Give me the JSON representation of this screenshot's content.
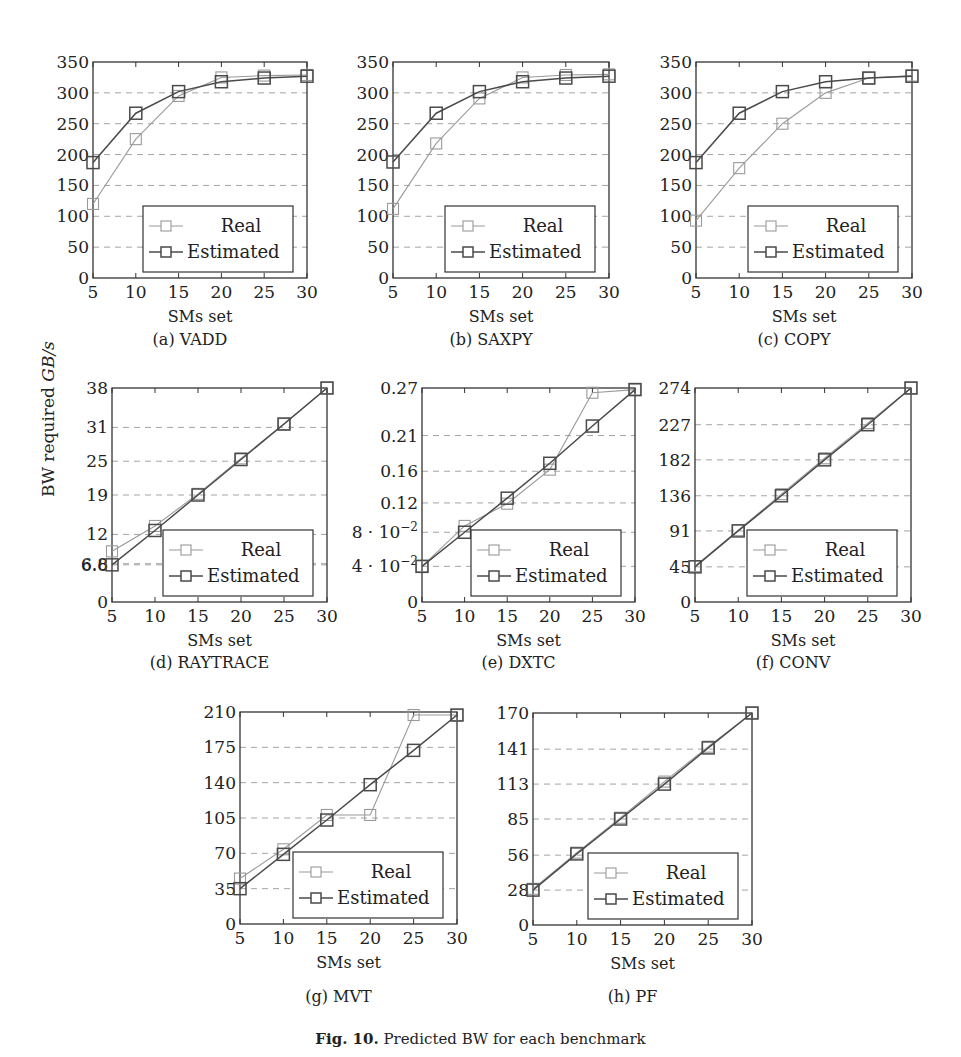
{
  "figure": {
    "caption_label": "Fig. 10.",
    "caption_text": "Predicted BW for each benchmark",
    "ylabel_prefix": "BW required ",
    "ylabel_unit": "GB/s",
    "legend": {
      "real": "Real",
      "estimated": "Estimated"
    },
    "colors": {
      "real": "#9a9a9a",
      "estimated": "#4a4a4a",
      "grid": "#9a9a9a",
      "axis": "#333333"
    }
  },
  "chart_data": [
    {
      "id": "a",
      "type": "line",
      "title": "(a) VADD",
      "xlabel": "SMs set",
      "ylabel": "BW required GB/s",
      "x": [
        5,
        10,
        15,
        20,
        25,
        30
      ],
      "xticks": [
        5,
        10,
        15,
        20,
        25,
        30
      ],
      "yticks": [
        0,
        50,
        100,
        150,
        200,
        250,
        300,
        350
      ],
      "ytick_labels": [
        "0",
        "50",
        "100",
        "150",
        "200",
        "250",
        "300",
        "350"
      ],
      "ylim": [
        0,
        350
      ],
      "grid": "horizontal dashed",
      "legend_position": "lower right",
      "series": [
        {
          "name": "Real",
          "values": [
            120,
            225,
            295,
            325,
            328,
            329
          ]
        },
        {
          "name": "Estimated",
          "values": [
            187,
            267,
            302,
            318,
            324,
            327
          ]
        }
      ]
    },
    {
      "id": "b",
      "type": "line",
      "title": "(b) SAXPY",
      "xlabel": "SMs set",
      "ylabel": "BW required GB/s",
      "x": [
        5,
        10,
        15,
        20,
        25,
        30
      ],
      "xticks": [
        5,
        10,
        15,
        20,
        25,
        30
      ],
      "yticks": [
        0,
        50,
        100,
        150,
        200,
        250,
        300,
        350
      ],
      "ytick_labels": [
        "0",
        "50",
        "100",
        "150",
        "200",
        "250",
        "300",
        "350"
      ],
      "ylim": [
        0,
        350
      ],
      "grid": "horizontal dashed",
      "legend_position": "lower right",
      "series": [
        {
          "name": "Real",
          "values": [
            112,
            218,
            291,
            325,
            329,
            330
          ]
        },
        {
          "name": "Estimated",
          "values": [
            188,
            267,
            302,
            318,
            324,
            327
          ]
        }
      ]
    },
    {
      "id": "c",
      "type": "line",
      "title": "(c) COPY",
      "xlabel": "SMs set",
      "ylabel": "BW required GB/s",
      "x": [
        5,
        10,
        15,
        20,
        25,
        30
      ],
      "xticks": [
        5,
        10,
        15,
        20,
        25,
        30
      ],
      "yticks": [
        0,
        50,
        100,
        150,
        200,
        250,
        300,
        350
      ],
      "ytick_labels": [
        "0",
        "50",
        "100",
        "150",
        "200",
        "250",
        "300",
        "350"
      ],
      "ylim": [
        0,
        350
      ],
      "grid": "horizontal dashed",
      "legend_position": "lower right",
      "series": [
        {
          "name": "Real",
          "values": [
            93,
            178,
            250,
            300,
            324,
            328
          ]
        },
        {
          "name": "Estimated",
          "values": [
            187,
            267,
            302,
            318,
            324,
            327
          ]
        }
      ]
    },
    {
      "id": "d",
      "type": "line",
      "title": "(d) RAYTRACE",
      "xlabel": "SMs set",
      "ylabel": "BW required GB/s",
      "x": [
        5,
        10,
        15,
        20,
        25,
        30
      ],
      "xticks": [
        5,
        10,
        15,
        20,
        25,
        30
      ],
      "yticks": [
        0,
        6.6,
        6.8,
        12,
        19,
        25,
        31,
        38
      ],
      "ytick_labels": [
        "0",
        "6.6",
        "6.8",
        "12",
        "19",
        "25",
        "31",
        "38"
      ],
      "ylim": [
        0,
        38
      ],
      "grid": "horizontal dashed",
      "legend_position": "lower right",
      "series": [
        {
          "name": "Real",
          "values": [
            9.0,
            13.5,
            19.2,
            25.5,
            31.6,
            38.0
          ]
        },
        {
          "name": "Estimated",
          "values": [
            6.6,
            12.7,
            19.0,
            25.3,
            31.6,
            38.0
          ]
        }
      ]
    },
    {
      "id": "e",
      "type": "line",
      "title": "(e) DXTC",
      "xlabel": "SMs set",
      "ylabel": "BW required GB/s",
      "x": [
        5,
        10,
        15,
        20,
        25,
        30
      ],
      "xticks": [
        5,
        10,
        15,
        20,
        25,
        30
      ],
      "yticks": [
        0,
        0.045,
        0.088,
        0.125,
        0.165,
        0.21,
        0.27
      ],
      "ytick_labels": [
        "0",
        "4·10⁻²",
        "8·10⁻²",
        "0.12",
        "0.16",
        "0.21",
        "0.27"
      ],
      "ylim": [
        0,
        0.27
      ],
      "grid": "horizontal dashed",
      "legend_position": "lower right",
      "series": [
        {
          "name": "Real",
          "values": [
            0.045,
            0.096,
            0.124,
            0.167,
            0.264,
            0.268
          ]
        },
        {
          "name": "Estimated",
          "values": [
            0.045,
            0.088,
            0.131,
            0.175,
            0.222,
            0.268
          ]
        }
      ]
    },
    {
      "id": "f",
      "type": "line",
      "title": "(f) CONV",
      "xlabel": "SMs set",
      "ylabel": "BW required GB/s",
      "x": [
        5,
        10,
        15,
        20,
        25,
        30
      ],
      "xticks": [
        5,
        10,
        15,
        20,
        25,
        30
      ],
      "yticks": [
        0,
        45,
        91,
        136,
        182,
        227,
        274
      ],
      "ytick_labels": [
        "0",
        "45",
        "91",
        "136",
        "182",
        "227",
        "274"
      ],
      "ylim": [
        0,
        274
      ],
      "grid": "horizontal dashed",
      "legend_position": "lower right",
      "series": [
        {
          "name": "Real",
          "values": [
            46,
            92,
            138,
            184,
            229,
            274
          ]
        },
        {
          "name": "Estimated",
          "values": [
            45,
            91,
            136,
            182,
            227,
            274
          ]
        }
      ]
    },
    {
      "id": "g",
      "type": "line",
      "title": "(g) MVT",
      "xlabel": "SMs set",
      "ylabel": "BW required GB/s",
      "x": [
        5,
        10,
        15,
        20,
        25,
        30
      ],
      "xticks": [
        5,
        10,
        15,
        20,
        25,
        30
      ],
      "yticks": [
        0,
        35,
        70,
        105,
        140,
        175,
        210
      ],
      "ytick_labels": [
        "0",
        "35",
        "70",
        "105",
        "140",
        "175",
        "210"
      ],
      "ylim": [
        0,
        210
      ],
      "grid": "horizontal dashed",
      "legend_position": "lower right",
      "series": [
        {
          "name": "Real",
          "values": [
            45,
            74,
            108,
            108,
            207,
            207
          ]
        },
        {
          "name": "Estimated",
          "values": [
            35,
            69,
            103,
            138,
            172,
            207
          ]
        }
      ]
    },
    {
      "id": "h",
      "type": "line",
      "title": "(h) PF",
      "xlabel": "SMs set",
      "ylabel": "BW required GB/s",
      "x": [
        5,
        10,
        15,
        20,
        25,
        30
      ],
      "xticks": [
        5,
        10,
        15,
        20,
        25,
        30
      ],
      "yticks": [
        0,
        28,
        56,
        85,
        113,
        141,
        170
      ],
      "ytick_labels": [
        "0",
        "28",
        "56",
        "85",
        "113",
        "141",
        "170"
      ],
      "ylim": [
        0,
        170
      ],
      "grid": "horizontal dashed",
      "legend_position": "lower right",
      "series": [
        {
          "name": "Real",
          "values": [
            29,
            58,
            86,
            115,
            143,
            170
          ]
        },
        {
          "name": "Estimated",
          "values": [
            28,
            57,
            85,
            113,
            142,
            170
          ]
        }
      ]
    }
  ],
  "layout": {
    "panels": [
      {
        "id": "a",
        "left": 93,
        "top": 62,
        "right": 307,
        "bottom": 278,
        "caption_y": 345
      },
      {
        "id": "b",
        "left": 393,
        "top": 62,
        "right": 609,
        "bottom": 278,
        "caption_y": 345
      },
      {
        "id": "c",
        "left": 696,
        "top": 62,
        "right": 912,
        "bottom": 278,
        "caption_y": 345
      },
      {
        "id": "d",
        "left": 112,
        "top": 388,
        "right": 327,
        "bottom": 602,
        "caption_y": 668
      },
      {
        "id": "e",
        "left": 422,
        "top": 388,
        "right": 635,
        "bottom": 602,
        "caption_y": 668
      },
      {
        "id": "f",
        "left": 695,
        "top": 388,
        "right": 911,
        "bottom": 602,
        "caption_y": 668
      },
      {
        "id": "g",
        "left": 240,
        "top": 712,
        "right": 457,
        "bottom": 924,
        "caption_y": 1002
      },
      {
        "id": "h",
        "left": 533,
        "top": 713,
        "right": 752,
        "bottom": 925,
        "caption_y": 1002
      }
    ]
  }
}
